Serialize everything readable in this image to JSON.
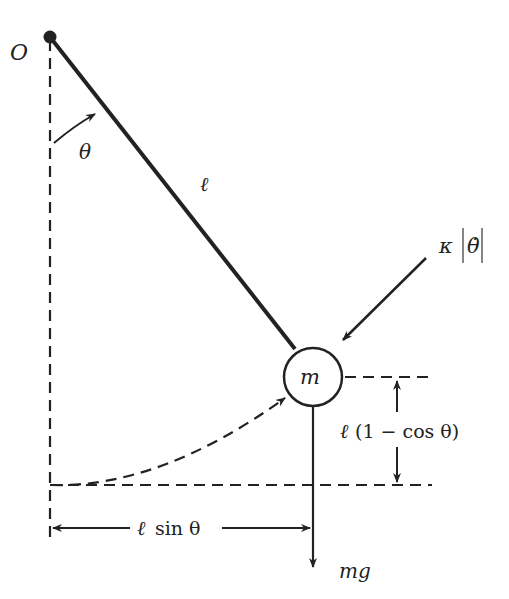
{
  "diagram": {
    "type": "pendulum free-body diagram",
    "colors": {
      "stroke": "#222222",
      "background": "#ffffff"
    },
    "labels": {
      "origin": "O",
      "angle": "θ",
      "length": "ℓ",
      "mass": "m",
      "damping_kappa": "κ",
      "damping_theta_dot": "θ̇",
      "height_ell": "ℓ",
      "height_expr": "(1 − cos θ)",
      "horizontal_ell": "ℓ",
      "horizontal_expr": "sin θ",
      "weight": "mg"
    }
  }
}
